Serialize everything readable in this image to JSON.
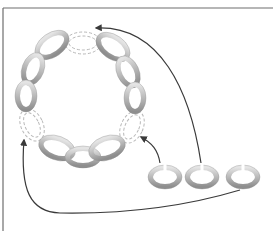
{
  "diagram": {
    "title": "",
    "frame": {
      "top_y": 8,
      "left_x": 3,
      "color": "#6e6e6e"
    },
    "colors": {
      "link_fill": "#bdbdbd",
      "link_highlight": "#e8e8e8",
      "link_shadow": "#8f8f8f",
      "dashed_gap": "#b8b8b8",
      "arrow": "#3a3a3a"
    },
    "chain_links": [
      {
        "id": "link-top-left",
        "cx": 52,
        "cy": 45,
        "rx": 19,
        "ry": 12,
        "rot": -35
      },
      {
        "id": "link-left-upper",
        "cx": 33,
        "cy": 69,
        "rx": 11,
        "ry": 17,
        "rot": 20
      },
      {
        "id": "link-left-lower",
        "cx": 26,
        "cy": 96,
        "rx": 11,
        "ry": 16,
        "rot": 0
      },
      {
        "id": "link-bottom-left",
        "cx": 57,
        "cy": 148,
        "rx": 19,
        "ry": 12,
        "rot": 20
      },
      {
        "id": "link-bottom-mid",
        "cx": 83,
        "cy": 157,
        "rx": 18,
        "ry": 11,
        "rot": 0
      },
      {
        "id": "link-bottom-right",
        "cx": 107,
        "cy": 148,
        "rx": 19,
        "ry": 12,
        "rot": -20
      },
      {
        "id": "link-top-right",
        "cx": 113,
        "cy": 47,
        "rx": 19,
        "ry": 12,
        "rot": 35
      },
      {
        "id": "link-right-upper",
        "cx": 128,
        "cy": 72,
        "rx": 11,
        "ry": 17,
        "rot": -25
      },
      {
        "id": "link-right-lower",
        "cx": 135,
        "cy": 98,
        "rx": 11,
        "ry": 16,
        "rot": 0
      }
    ],
    "gaps": [
      {
        "id": "gap-top",
        "cx": 83,
        "cy": 43,
        "rx": 18,
        "ry": 11,
        "rot": 0
      },
      {
        "id": "gap-left",
        "cx": 32,
        "cy": 125,
        "rx": 11,
        "ry": 17,
        "rot": -25
      },
      {
        "id": "gap-right",
        "cx": 132,
        "cy": 127,
        "rx": 11,
        "ry": 17,
        "rot": 25
      }
    ],
    "loose_rings": [
      {
        "id": "loose-ring-1",
        "cx": 165,
        "cy": 177,
        "rx": 17,
        "ry": 12
      },
      {
        "id": "loose-ring-2",
        "cx": 202,
        "cy": 177,
        "rx": 17,
        "ry": 12
      },
      {
        "id": "loose-ring-3",
        "cx": 243,
        "cy": 177,
        "rx": 17,
        "ry": 12
      }
    ],
    "arrows": [
      {
        "id": "arrow-ring1-to-right-gap",
        "from": "loose-ring-1",
        "to": "gap-right",
        "path": "M160 163 C158 150 152 143 141 137"
      },
      {
        "id": "arrow-ring2-to-top-gap",
        "from": "loose-ring-2",
        "to": "gap-top",
        "path": "M201 163 C190 90 160 25 96 28"
      },
      {
        "id": "arrow-ring3-to-left-gap",
        "from": "loose-ring-3",
        "to": "gap-left",
        "path": "M240 190 C180 208 120 214 60 213 C30 212 20 190 24 140"
      }
    ]
  }
}
